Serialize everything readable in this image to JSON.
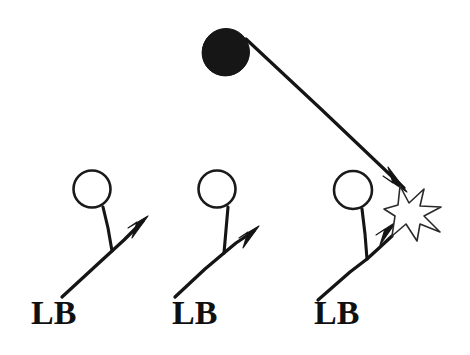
{
  "diagram": {
    "background_color": "#ffffff",
    "ink_color": "#151515",
    "width": 470,
    "height": 355,
    "ball_carrier": {
      "name": "ball-carrier",
      "shape": "filled-circle",
      "cx": 226,
      "cy": 52,
      "r": 23.5,
      "fill": "#161616"
    },
    "ball_path": {
      "name": "ball-path-arrow",
      "from_x": 246,
      "from_y": 39,
      "to_x": 404,
      "to_y": 188,
      "arrowhead": "solid-triangle"
    },
    "collision": {
      "name": "collision-burst",
      "shape": "starburst",
      "cx": 411,
      "cy": 212,
      "fill": "#ffffff",
      "stroke": "#2a2a2a"
    },
    "players": [
      {
        "label": "LB",
        "circle_cx": 92,
        "circle_cy": 189,
        "circle_r": 18.5,
        "stem_x1": 103,
        "stem_y1": 207,
        "stem_x2": 112,
        "stem_y2": 251,
        "shaft_x1": 62,
        "shaft_y1": 297,
        "shaft_x2": 143,
        "shaft_y2": 221,
        "label_left": 31,
        "label_top": 296
      },
      {
        "label": "LB",
        "circle_cx": 217,
        "circle_cy": 189,
        "circle_r": 18.5,
        "stem_x1": 228,
        "stem_y1": 207,
        "stem_x2": 224,
        "stem_y2": 253,
        "shaft_x1": 175,
        "shaft_y1": 297,
        "shaft_x2": 254,
        "shaft_y2": 231,
        "label_left": 172,
        "label_top": 296
      },
      {
        "label": "LB",
        "circle_cx": 353,
        "circle_cy": 190,
        "circle_r": 19,
        "stem_x1": 362,
        "stem_y1": 209,
        "stem_x2": 367,
        "stem_y2": 259,
        "shaft_x1": 318,
        "shaft_y1": 300,
        "shaft_x2": 392,
        "shaft_y2": 226,
        "label_left": 314,
        "label_top": 296
      }
    ]
  }
}
